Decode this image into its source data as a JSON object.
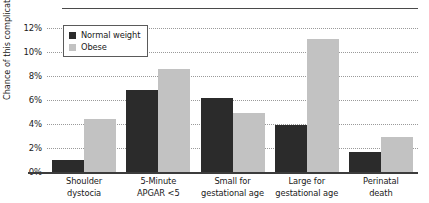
{
  "chart_data": {
    "type": "bar",
    "title": "",
    "xlabel": "",
    "ylabel": "Chance of this complication",
    "ylim": [
      0,
      12
    ],
    "ytick_values": [
      0,
      2,
      4,
      6,
      8,
      10,
      12
    ],
    "ytick_labels": [
      "0%",
      "2%",
      "4%",
      "6%",
      "8%",
      "10%",
      "12%"
    ],
    "grid": true,
    "legend_position": "upper left",
    "categories": [
      "Shoulder dystocia",
      "5-Minute APGAR <5",
      "Small for gestational age",
      "Large for gestational age",
      "Perinatal death"
    ],
    "category_lines": [
      [
        "Shoulder",
        "dystocia"
      ],
      [
        "5-Minute",
        "APGAR <5"
      ],
      [
        "Small for",
        "gestational age"
      ],
      [
        "Large for",
        "gestational age"
      ],
      [
        "Perinatal",
        "death"
      ]
    ],
    "series": [
      {
        "name": "Normal weight",
        "color": "#2b2b2b",
        "values": [
          1.0,
          6.8,
          6.2,
          3.9,
          1.7
        ]
      },
      {
        "name": "Obese",
        "color": "#c2c2c2",
        "values": [
          4.4,
          8.6,
          4.9,
          11.1,
          2.9
        ]
      }
    ]
  }
}
